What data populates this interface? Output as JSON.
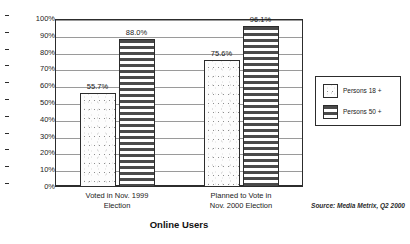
{
  "chart_data": {
    "type": "bar",
    "title": "Online Users",
    "xlabel": "",
    "ylabel": "",
    "ylim": [
      0,
      100
    ],
    "ytick_labels": [
      "100%",
      "90%",
      "80%",
      "70%",
      "60%",
      "50%",
      "40%",
      "30%",
      "20%",
      "10%",
      "0%"
    ],
    "ytick_values": [
      100,
      90,
      80,
      70,
      60,
      50,
      40,
      30,
      20,
      10,
      0
    ],
    "grid": true,
    "legend_position": "right",
    "categories": [
      "Voted in Nov. 1999 Election",
      "Planned to Vote in Nov. 2000 Election"
    ],
    "category_lines": [
      [
        "Voted in Nov. 1999",
        "Election"
      ],
      [
        "Planned to Vote in",
        "Nov. 2000 Election"
      ]
    ],
    "series": [
      {
        "name": "Persons 18 +",
        "pattern": "speckle",
        "values": [
          55.7,
          75.6
        ],
        "labels": [
          "55.7%",
          "75.6%"
        ]
      },
      {
        "name": "Persons 50 +",
        "pattern": "horizontal-stripes",
        "values": [
          88.0,
          96.1
        ],
        "labels": [
          "88.0%",
          "96.1%"
        ]
      }
    ],
    "source": "Source: Media Metrix, Q2 2000",
    "colors": {
      "axis": "#2c2c2c",
      "grid": "#9a9a9a",
      "stripe": "#4a4a4a",
      "text": "#1a1a1a",
      "background": "#ffffff"
    }
  }
}
